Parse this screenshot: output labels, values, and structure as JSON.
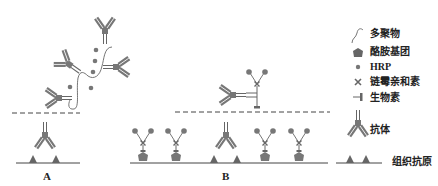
{
  "figure": {
    "panels": [
      {
        "id": "A",
        "label": "A"
      },
      {
        "id": "B",
        "label": "B"
      }
    ],
    "legend": {
      "items": [
        {
          "icon": "polymer-icon",
          "label": "多聚物"
        },
        {
          "icon": "tyramide-group-icon",
          "label": "酪胺基团"
        },
        {
          "icon": "hrp-dot-icon",
          "label": "HRP"
        },
        {
          "icon": "streptavidin-cross-icon",
          "label": "链霉亲和素"
        },
        {
          "icon": "biotin-icon",
          "label": "生物素"
        },
        {
          "icon": "antibody-icon",
          "label": "抗体"
        },
        {
          "icon": "tissue-antigen-icon",
          "label": "组织抗原"
        }
      ]
    },
    "colors": {
      "ink": "#555555",
      "line": "#333333",
      "fill": "#6a6a6a"
    }
  }
}
